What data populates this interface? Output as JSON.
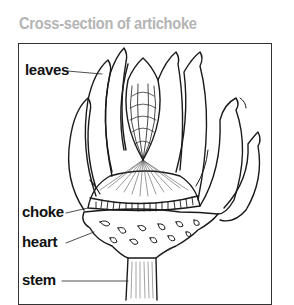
{
  "title": "Cross-section of artichoke",
  "labels": {
    "leaves": "leaves",
    "choke": "choke",
    "heart": "heart",
    "stem": "stem"
  },
  "colors": {
    "title": "#b4b4b4",
    "ink": "#111111",
    "frame": "#333333"
  }
}
